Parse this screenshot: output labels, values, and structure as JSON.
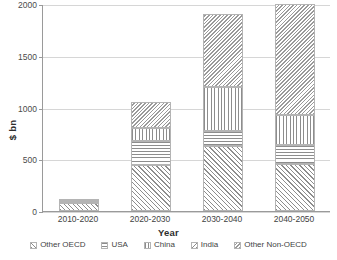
{
  "chart_data": {
    "type": "bar",
    "stacked": true,
    "title": "",
    "xlabel": "Year",
    "ylabel": "$ bn",
    "categories": [
      "2010-2020",
      "2020-2030",
      "2030-2040",
      "2040-2050"
    ],
    "ylim": [
      0,
      2000
    ],
    "yticks": [
      0,
      500,
      1000,
      1500,
      2000
    ],
    "ytick_labels": [
      "0",
      "500",
      "1000",
      "1500",
      "2000"
    ],
    "grid": true,
    "legend_position": "bottom",
    "series": [
      {
        "name": "Other OECD",
        "pattern": "diagonal-up",
        "values": [
          75,
          440,
          625,
          450
        ]
      },
      {
        "name": "USA",
        "pattern": "horizontal",
        "values": [
          8,
          240,
          150,
          190
        ]
      },
      {
        "name": "China",
        "pattern": "vertical",
        "values": [
          6,
          125,
          420,
          290
        ]
      },
      {
        "name": "India",
        "pattern": "diagonal-down",
        "values": [
          3,
          0,
          0,
          0
        ]
      },
      {
        "name": "Other Non-OECD",
        "pattern": "dense-diagonal",
        "values": [
          3,
          250,
          705,
          1070
        ]
      }
    ],
    "totals": [
      95,
      1055,
      1900,
      2000
    ]
  },
  "axes": {
    "y": {
      "label": "$ bn",
      "ticks": [
        {
          "value": 2000,
          "label": "2000"
        },
        {
          "value": 1500,
          "label": "1500"
        },
        {
          "value": 1000,
          "label": "1000"
        },
        {
          "value": 500,
          "label": "500"
        },
        {
          "value": 0,
          "label": "0"
        }
      ]
    },
    "x": {
      "label": "Year",
      "ticks": [
        {
          "label": "2010-2020"
        },
        {
          "label": "2020-2030"
        },
        {
          "label": "2030-2040"
        },
        {
          "label": "2040-2050"
        }
      ]
    }
  },
  "legend": {
    "items": [
      {
        "label": "Other OECD"
      },
      {
        "label": "USA"
      },
      {
        "label": "China"
      },
      {
        "label": "India"
      },
      {
        "label": "Other Non-OECD"
      }
    ]
  },
  "colors": {
    "hatch": "#8d8d8d",
    "background": "#ffffff",
    "gridline": "#d6d6d6",
    "axis": "#9a9a9a",
    "text": "#3f3f3f"
  }
}
